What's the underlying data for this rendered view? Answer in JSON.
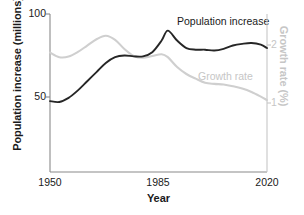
{
  "chart_data": {
    "type": "line",
    "title": "",
    "xlabel": "Year",
    "ylabel": "Population increase (millions)",
    "y2label": "Growth rate (%)",
    "xlim": [
      1950,
      2020
    ],
    "ylim": [
      0,
      100
    ],
    "y2lim": [
      0.28,
      2.72
    ],
    "grid": false,
    "legend_position": "inline-annotations",
    "x_ticks": [
      1950,
      1985,
      2020
    ],
    "x_tick_labels": [
      "1950",
      "1985",
      "2020"
    ],
    "y_ticks": [
      50,
      100
    ],
    "y_tick_labels": [
      "50",
      "100"
    ],
    "y2_ticks": [
      1,
      2
    ],
    "y2_tick_labels": [
      "1",
      "2"
    ],
    "series": [
      {
        "name": "Population increase",
        "axis": "left",
        "color": "#262626",
        "units": "millions",
        "x": [
          1950,
          1953,
          1956,
          1959,
          1962,
          1965,
          1968,
          1971,
          1974,
          1977,
          1980,
          1983,
          1986,
          1988,
          1991,
          1994,
          1997,
          2000,
          2003,
          2006,
          2009,
          2012,
          2015,
          2018,
          2020
        ],
        "values": [
          47.5,
          47.0,
          49.5,
          54.0,
          59.5,
          65.0,
          70.5,
          74.0,
          75.0,
          74.5,
          74.5,
          77.0,
          84.0,
          90.0,
          84.0,
          79.5,
          78.5,
          78.5,
          78.0,
          79.0,
          81.0,
          82.0,
          82.5,
          81.5,
          79.5
        ]
      },
      {
        "name": "Growth rate",
        "axis": "right",
        "color": "#cfcfcf",
        "units": "%",
        "x": [
          1950,
          1953,
          1956,
          1959,
          1962,
          1965,
          1968,
          1971,
          1974,
          1977,
          1980,
          1983,
          1986,
          1988,
          1991,
          1994,
          1997,
          2000,
          2003,
          2006,
          2009,
          2012,
          2015,
          2018,
          2020
        ],
        "values": [
          1.87,
          1.79,
          1.8,
          1.88,
          1.99,
          2.1,
          2.16,
          2.09,
          1.93,
          1.81,
          1.78,
          1.81,
          1.84,
          1.79,
          1.62,
          1.5,
          1.42,
          1.35,
          1.33,
          1.32,
          1.29,
          1.25,
          1.19,
          1.11,
          1.05
        ]
      }
    ],
    "annotations": [
      {
        "name": "Population increase",
        "text": "Population increase",
        "color": "#1a1a1a"
      },
      {
        "name": "Growth rate",
        "text": "Growth rate",
        "color": "#c6c6c6"
      }
    ]
  },
  "axes": {
    "left": {
      "title": "Population increase (millions)",
      "ticks": [
        {
          "label": "100"
        },
        {
          "label": "50"
        }
      ]
    },
    "right": {
      "title": "Growth rate (%)",
      "ticks": [
        {
          "label": "2"
        },
        {
          "label": "1"
        }
      ]
    },
    "bottom": {
      "title": "Year",
      "ticks": [
        {
          "label": "1950"
        },
        {
          "label": "1985"
        },
        {
          "label": "2020"
        }
      ]
    }
  },
  "colors": {
    "population_line": "#262626",
    "growth_line": "#cfcfcf",
    "axis": "#7a7a7a",
    "axis_right": "#c6c6c6",
    "text": "#1a1a1a",
    "text_muted": "#c6c6c6",
    "background": "#ffffff"
  }
}
